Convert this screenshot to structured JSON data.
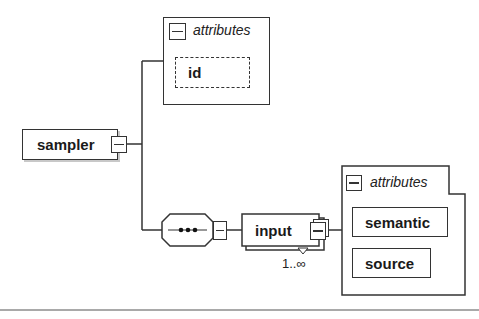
{
  "diagram": {
    "root": {
      "label": "sampler"
    },
    "root_attributes": {
      "header": "attributes",
      "items": [
        {
          "label": "id",
          "optional": true
        }
      ]
    },
    "compositor": {
      "type": "sequence",
      "glyph": "•••"
    },
    "child": {
      "label": "input",
      "multiplicity": "1..∞"
    },
    "child_attributes": {
      "header": "attributes",
      "items": [
        {
          "label": "semantic"
        },
        {
          "label": "source"
        }
      ]
    },
    "colors": {
      "stroke": "#333333",
      "background": "#ffffff",
      "shadow": "#c8c8c8"
    }
  }
}
